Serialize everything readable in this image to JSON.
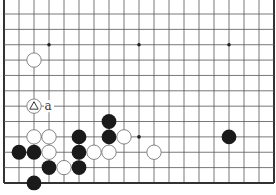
{
  "diagram": {
    "type": "go-board-diagram",
    "board": {
      "columns": 19,
      "rows_visible": 12,
      "edges": [
        "left",
        "right",
        "bottom"
      ],
      "origin_x": 4,
      "origin_y": 14,
      "spacing_x": 15,
      "spacing_y": 15.36
    },
    "colors": {
      "line": "#555555",
      "edge": "#333333",
      "black_stone": "#1a1a1a",
      "white_stone_fill": "#ffffff",
      "white_stone_stroke": "#777777",
      "star_point": "#222222"
    },
    "star_points": [
      {
        "col": 3,
        "row": 2
      },
      {
        "col": 9,
        "row": 2
      },
      {
        "col": 15,
        "row": 2
      },
      {
        "col": 9,
        "row": 8
      }
    ],
    "stones": [
      {
        "color": "white",
        "col": 2,
        "row": 3
      },
      {
        "color": "white",
        "col": 2,
        "row": 6,
        "marker": "triangle"
      },
      {
        "color": "black",
        "col": 7,
        "row": 7
      },
      {
        "color": "white",
        "col": 2,
        "row": 8
      },
      {
        "color": "white",
        "col": 3,
        "row": 8
      },
      {
        "color": "black",
        "col": 5,
        "row": 8
      },
      {
        "color": "black",
        "col": 7,
        "row": 8
      },
      {
        "color": "white",
        "col": 8,
        "row": 8
      },
      {
        "color": "black",
        "col": 15,
        "row": 8
      },
      {
        "color": "black",
        "col": 1,
        "row": 9
      },
      {
        "color": "black",
        "col": 2,
        "row": 9
      },
      {
        "color": "white",
        "col": 3,
        "row": 9
      },
      {
        "color": "black",
        "col": 5,
        "row": 9
      },
      {
        "color": "white",
        "col": 6,
        "row": 9
      },
      {
        "color": "white",
        "col": 7,
        "row": 9
      },
      {
        "color": "white",
        "col": 10,
        "row": 9
      },
      {
        "color": "black",
        "col": 3,
        "row": 10
      },
      {
        "color": "white",
        "col": 4,
        "row": 10
      },
      {
        "color": "black",
        "col": 5,
        "row": 10
      },
      {
        "color": "black",
        "col": 2,
        "row": 11
      }
    ],
    "labels": [
      {
        "text": "a",
        "col": 3,
        "row": 6
      }
    ]
  }
}
